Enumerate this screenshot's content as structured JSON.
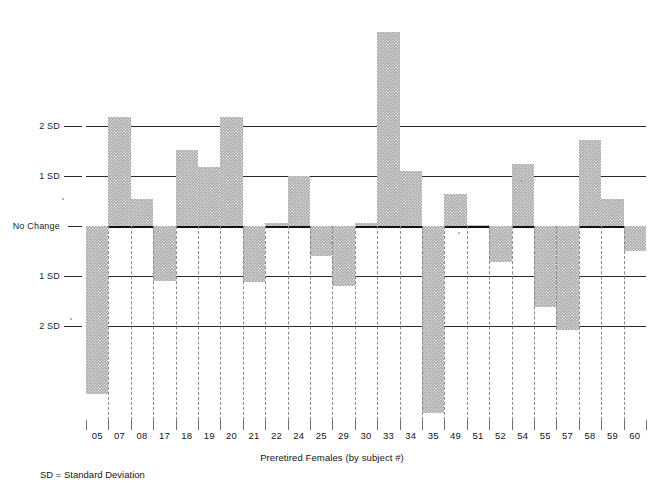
{
  "chart_data": {
    "type": "bar",
    "title": "",
    "xlabel": "Preretired Females (by subject #)",
    "ylabel": "",
    "orientation": "vertical",
    "baseline_label": "No Change",
    "grid": true,
    "legend": "none",
    "ylim": [
      -4.1,
      4.3
    ],
    "y_unit": "SD",
    "y_ticks": [
      2,
      1,
      0,
      -1,
      -2
    ],
    "y_tick_labels": [
      "2 SD",
      "1 SD",
      "No Change",
      "1 SD",
      "2 SD"
    ],
    "categories": [
      "05",
      "07",
      "08",
      "17",
      "18",
      "19",
      "20",
      "21",
      "22",
      "24",
      "25",
      "29",
      "30",
      "33",
      "34",
      "35",
      "49",
      "51",
      "52",
      "54",
      "55",
      "57",
      "58",
      "59",
      "60"
    ],
    "values": [
      -3.38,
      2.2,
      0.55,
      -1.1,
      1.52,
      1.19,
      2.2,
      -1.12,
      0.06,
      1.0,
      -0.6,
      -1.2,
      0.05,
      3.9,
      1.1,
      -3.76,
      0.65,
      0.02,
      -0.72,
      1.25,
      -1.62,
      -2.1,
      1.72,
      0.55,
      -0.5
    ]
  },
  "axis": {
    "y_labels": [
      {
        "text": "2 SD",
        "value": 2
      },
      {
        "text": "1 SD",
        "value": 1
      },
      {
        "text": "No Change",
        "value": 0
      },
      {
        "text": "1 SD",
        "value": -1
      },
      {
        "text": "2 SD",
        "value": -2
      }
    ],
    "x_title": "Preretired Females (by subject #)"
  },
  "footnote": "SD = Standard Deviation",
  "caption": ""
}
